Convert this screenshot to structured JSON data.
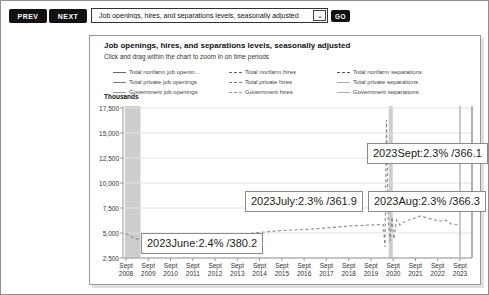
{
  "toolbar": {
    "prev_label": "PREV",
    "next_label": "NEXT",
    "go_label": "GO",
    "series_select": {
      "value": "Job openings, hires, and separations levels, seasonally adjusted"
    }
  },
  "chart": {
    "title": "Job openings, hires, and separations levels, seasonally adjusted",
    "subtitle": "Click and drag within the chart to zoom in on time periods",
    "y_axis_label": "Thousands",
    "legend": {
      "columns": [
        {
          "items": [
            {
              "label": "Total nonfarm job openin...",
              "dash": "solid",
              "color": "#666666"
            },
            {
              "label": "Total private job openings",
              "dash": "solid",
              "color": "#777777"
            },
            {
              "label": "Government job openings",
              "dash": "solid",
              "color": "#999999"
            }
          ]
        },
        {
          "items": [
            {
              "label": "Total nonfarm hires",
              "dash": "dashed",
              "color": "#666666"
            },
            {
              "label": "Total private hires",
              "dash": "dashed",
              "color": "#777777"
            },
            {
              "label": "Government hires",
              "dash": "dashed",
              "color": "#999999"
            }
          ]
        },
        {
          "items": [
            {
              "label": "Total nonfarm separations",
              "dash": "dashed",
              "color": "#555555"
            },
            {
              "label": "Total private separations",
              "dash": "solid",
              "color": "#aaaaaa"
            },
            {
              "label": "Government separations",
              "dash": "solid",
              "color": "#aaaaaa"
            }
          ]
        }
      ]
    }
  },
  "chart_data": {
    "type": "line",
    "title": "Job openings, hires, and separations levels, seasonally adjusted",
    "xlabel": "",
    "ylabel": "Thousands",
    "ylim": [
      2500,
      17500
    ],
    "x_range": [
      2008.75,
      2023.75
    ],
    "grid": "horizontal",
    "legend_position": "top",
    "y_ticks": [
      "17,500",
      "15,000",
      "12,500",
      "10,000",
      "7,500",
      "5,000",
      "2,500"
    ],
    "x_ticks": [
      "Sept 2008",
      "Sept 2009",
      "Sept 2010",
      "Sept 2011",
      "Sept 2012",
      "Sept 2013",
      "Sept 2014",
      "Sept 2015",
      "Sept 2016",
      "Sept 2017",
      "Sept 2018",
      "Sept 2019",
      "Sept 2020",
      "Sept 2021",
      "Sept 2022",
      "Sept 2023"
    ],
    "recession_bands": [
      [
        2008.7,
        2009.4
      ],
      [
        2020.55,
        2020.73
      ]
    ],
    "crosshair_x": 2023.75,
    "series": [
      {
        "name": "Total nonfarm hires",
        "style": "dashed",
        "color": "#8a8a8a",
        "points": [
          [
            2008.75,
            4950
          ],
          [
            2009.1,
            4500
          ],
          [
            2009.5,
            4250
          ],
          [
            2010.0,
            4400
          ],
          [
            2010.75,
            4450
          ],
          [
            2011.75,
            4600
          ],
          [
            2012.75,
            4700
          ],
          [
            2013.75,
            4850
          ],
          [
            2014.75,
            5050
          ],
          [
            2015.75,
            5250
          ],
          [
            2016.75,
            5350
          ],
          [
            2017.75,
            5500
          ],
          [
            2018.75,
            5700
          ],
          [
            2019.75,
            5800
          ],
          [
            2020.3,
            5850
          ],
          [
            2020.38,
            3600
          ],
          [
            2020.45,
            16300
          ],
          [
            2020.52,
            6500
          ],
          [
            2020.6,
            4200
          ],
          [
            2020.7,
            6600
          ],
          [
            2020.78,
            4400
          ],
          [
            2020.9,
            6300
          ],
          [
            2021.05,
            5800
          ],
          [
            2021.3,
            6200
          ],
          [
            2021.6,
            6400
          ],
          [
            2021.95,
            6700
          ],
          [
            2022.3,
            6500
          ],
          [
            2022.6,
            6300
          ],
          [
            2022.9,
            6200
          ],
          [
            2023.1,
            6300
          ],
          [
            2023.35,
            5900
          ],
          [
            2023.6,
            5850
          ],
          [
            2023.75,
            5870
          ]
        ]
      }
    ],
    "annotations": [
      {
        "text": "2023June:2.4% /380.2"
      },
      {
        "text": "2023July:2.3% /361.9"
      },
      {
        "text": "2023Aug:2.3% /366.3"
      },
      {
        "text": "2023Sept:2.3% /366.1"
      }
    ]
  },
  "tooltips": [
    {
      "text": "2023June:2.4% /380.2",
      "left": 140,
      "top": 232
    },
    {
      "text": "2023July:2.3% /361.9",
      "left": 244,
      "top": 190
    },
    {
      "text": "2023Aug:2.3% /366.3",
      "left": 367,
      "top": 190
    },
    {
      "text": "2023Sept:2.3% /366.1",
      "left": 366,
      "top": 142
    }
  ],
  "colors": {
    "button_bg": "#111111",
    "recession_band": "#cdcdcd",
    "gridline": "#e2e2e2",
    "axis": "#999999",
    "crosshair": "#b5b5b5"
  }
}
